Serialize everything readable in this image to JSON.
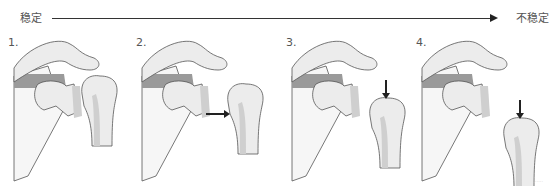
{
  "scale": {
    "left_label": "稳定",
    "right_label": "不稳定",
    "axis_color": "#222222"
  },
  "panels": [
    {
      "number": "1.",
      "humerus_dx": 0,
      "humerus_dy": 0,
      "arrow": "none"
    },
    {
      "number": "2.",
      "humerus_dx": 18,
      "humerus_dy": 8,
      "arrow": "right"
    },
    {
      "number": "3.",
      "humerus_dx": 10,
      "humerus_dy": 22,
      "arrow": "down"
    },
    {
      "number": "4.",
      "humerus_dx": 14,
      "humerus_dy": 42,
      "arrow": "down"
    }
  ],
  "colors": {
    "bone_fill": "#ececec",
    "bone_light": "#f6f6f6",
    "bone_shade": "#cfcfcf",
    "dark_band": "#9a9a9a",
    "outline": "#555555",
    "arrow": "#222222"
  },
  "watermark": "·····"
}
